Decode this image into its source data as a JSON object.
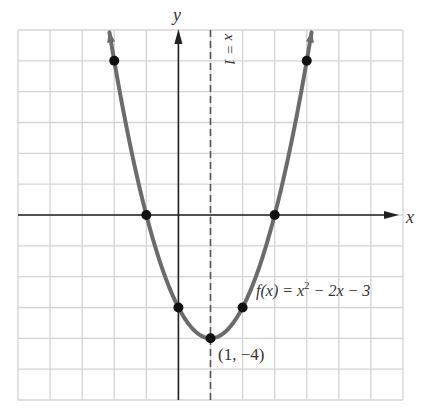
{
  "chart_data": {
    "type": "line",
    "title": "",
    "function_label": "f(x) = x² − 2x − 3",
    "function_label_parts": {
      "lhs": "f(x) = x",
      "exp": "2",
      "rhs": " − 2x − 3"
    },
    "xlabel": "x",
    "ylabel": "y",
    "xlim": [
      -5,
      7
    ],
    "ylim": [
      -6,
      6
    ],
    "grid": true,
    "axis_of_symmetry": {
      "x": 1,
      "label": "x = 1",
      "style": "dashed"
    },
    "vertex": {
      "x": 1,
      "y": -4,
      "label": "(1, −4)"
    },
    "series": [
      {
        "name": "f(x) = x^2 - 2x - 3",
        "marked_points": [
          {
            "x": -2,
            "y": 5
          },
          {
            "x": -1,
            "y": 0
          },
          {
            "x": 0,
            "y": -3
          },
          {
            "x": 1,
            "y": -4
          },
          {
            "x": 2,
            "y": -3
          },
          {
            "x": 3,
            "y": 0
          },
          {
            "x": 4,
            "y": 5
          }
        ],
        "curve_domain": [
          -2.15,
          4.15
        ]
      }
    ]
  },
  "colors": {
    "curve": "#6b6b6b",
    "grid": "#d4d4d4",
    "axis": "#222222",
    "point": "#111111",
    "dashed": "#555555",
    "text": "#333333"
  }
}
